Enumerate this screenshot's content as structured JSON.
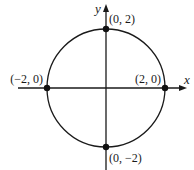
{
  "diagram": {
    "type": "circle-on-axes",
    "axes": {
      "x_label": "x",
      "y_label": "y"
    },
    "circle": {
      "center": [
        0,
        0
      ],
      "radius": 2
    },
    "points": [
      {
        "coords": [
          0,
          2
        ],
        "label": "(0, 2)"
      },
      {
        "coords": [
          2,
          0
        ],
        "label": "(2, 0)"
      },
      {
        "coords": [
          -2,
          0
        ],
        "label": "(−2, 0)"
      },
      {
        "coords": [
          0,
          -2
        ],
        "label": "(0, −2)"
      }
    ]
  }
}
